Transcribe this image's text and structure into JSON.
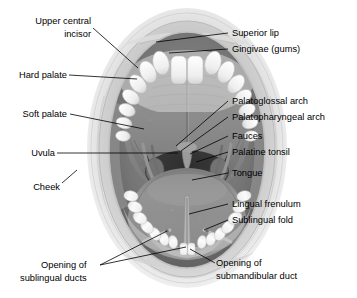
{
  "figure": {
    "type": "anatomical-illustration",
    "style": "grayscale halftone line-art with leader lines",
    "colors": {
      "background": "#ffffff",
      "label_text": "#000000",
      "leader_line": "#000000",
      "outer_face": "#d8d8d8",
      "lip_ring": "#c8c8c8",
      "vestibule_dark": "#6f6f6f",
      "teeth": "#f2f2f2",
      "hard_palate": "#8a8a8a",
      "soft_palate": "#7d7d7d",
      "fauces_dark": "#3a3a3a",
      "tongue": "#8f8f8f",
      "floor_mouth": "#9a9a9a"
    }
  },
  "labels": {
    "upper_central_incisor_line1": "Upper central",
    "upper_central_incisor_line2": "incisor",
    "hard_palate": "Hard palate",
    "soft_palate": "Soft palate",
    "uvula": "Uvula",
    "cheek": "Cheek",
    "superior_lip": "Superior lip",
    "gingivae": "Gingivae (gums)",
    "palatoglossal_arch": "Palatoglossal arch",
    "palatopharyngeal_arch": "Palatopharyngeal arch",
    "fauces": "Fauces",
    "palatine_tonsil": "Palatine tonsil",
    "tongue": "Tongue",
    "lingual_frenulum": "Lingual frenulum",
    "sublingual_fold": "Sublingual fold",
    "opening_sublingual_ducts_line1": "Opening of",
    "opening_sublingual_ducts_line2": "sublingual ducts",
    "opening_submandibular_duct_line1": "Opening of",
    "opening_submandibular_duct_line2": "submandibular duct"
  },
  "structures": [
    "superior lip",
    "gingivae (gums)",
    "upper central incisor",
    "hard palate",
    "soft palate",
    "uvula",
    "palatoglossal arch",
    "palatopharyngeal arch",
    "fauces",
    "palatine tonsil",
    "tongue",
    "lingual frenulum",
    "sublingual fold",
    "cheek",
    "opening of sublingual ducts",
    "opening of submandibular duct"
  ]
}
